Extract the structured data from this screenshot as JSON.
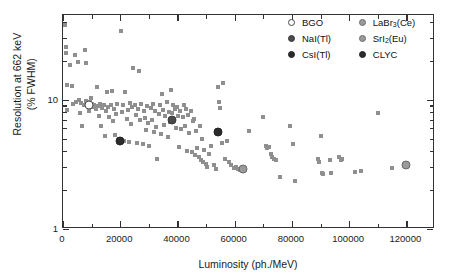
{
  "chart_data": {
    "type": "scatter",
    "title": "",
    "xlabel": "Luminosity (ph./MeV)",
    "ylabel": "Resolution at 662 keV (% FWHM)",
    "ylabel_line1": "Resolution at 662 keV",
    "ylabel_line2": "(% FWHM)",
    "xlim": [
      0,
      130000
    ],
    "ylim": [
      1,
      45
    ],
    "yscale": "log",
    "xscale": "linear",
    "grid": false,
    "legend_position": "top-right",
    "x_ticks_major": [
      0,
      20000,
      40000,
      60000,
      80000,
      100000,
      120000
    ],
    "x_tick_labels": [
      "0",
      "20000",
      "40000",
      "60000",
      "80000",
      "100000",
      "120000"
    ],
    "x_ticks_minor": [
      10000,
      30000,
      50000,
      70000,
      90000,
      110000
    ],
    "y_ticks_major": [
      1,
      10
    ],
    "y_tick_labels": [
      "1",
      "10"
    ],
    "y_ticks_minor": [
      2,
      3,
      4,
      5,
      6,
      7,
      8,
      9,
      20,
      30,
      40
    ],
    "series": [
      {
        "name": "scintillator-survey",
        "marker": "square",
        "color": "#8f8f8f",
        "points": [
          [
            700,
            38.0
          ],
          [
            900,
            25.5
          ],
          [
            1100,
            23.0
          ],
          [
            1300,
            13.0
          ],
          [
            1500,
            8.3
          ],
          [
            2600,
            18.5
          ],
          [
            3100,
            12.8
          ],
          [
            3400,
            9.2
          ],
          [
            4200,
            22.0
          ],
          [
            4600,
            9.6
          ],
          [
            5200,
            19.5
          ],
          [
            5600,
            9.9
          ],
          [
            6000,
            7.9
          ],
          [
            6400,
            9.4
          ],
          [
            6800,
            6.3
          ],
          [
            7200,
            9.1
          ],
          [
            7600,
            24.0
          ],
          [
            7900,
            19.3
          ],
          [
            8200,
            9.7
          ],
          [
            8600,
            9.0
          ],
          [
            9000,
            8.1
          ],
          [
            9400,
            9.5
          ],
          [
            9800,
            10.3
          ],
          [
            10200,
            9.2
          ],
          [
            10600,
            8.7
          ],
          [
            11000,
            9.0
          ],
          [
            11400,
            8.4
          ],
          [
            11800,
            12.5
          ],
          [
            12200,
            8.9
          ],
          [
            12600,
            7.5
          ],
          [
            13000,
            9.3
          ],
          [
            13400,
            6.2
          ],
          [
            13800,
            8.6
          ],
          [
            14200,
            9.1
          ],
          [
            14600,
            5.2
          ],
          [
            15000,
            8.2
          ],
          [
            15400,
            11.4
          ],
          [
            15800,
            8.8
          ],
          [
            16200,
            7.3
          ],
          [
            16600,
            9.0
          ],
          [
            17000,
            11.6
          ],
          [
            17400,
            6.8
          ],
          [
            17800,
            8.5
          ],
          [
            18200,
            5.3
          ],
          [
            18600,
            7.8
          ],
          [
            19000,
            9.2
          ],
          [
            19400,
            5.0
          ],
          [
            19800,
            4.9
          ],
          [
            20200,
            34.0
          ],
          [
            20600,
            8.0
          ],
          [
            21000,
            9.1
          ],
          [
            21400,
            4.8
          ],
          [
            21800,
            11.5
          ],
          [
            22200,
            7.1
          ],
          [
            22600,
            8.3
          ],
          [
            23000,
            4.7
          ],
          [
            23400,
            9.4
          ],
          [
            23800,
            6.5
          ],
          [
            24200,
            8.7
          ],
          [
            24600,
            17.5
          ],
          [
            25000,
            9.0
          ],
          [
            25400,
            7.6
          ],
          [
            25800,
            4.6
          ],
          [
            26200,
            8.4
          ],
          [
            26600,
            16.5
          ],
          [
            27000,
            6.9
          ],
          [
            27400,
            9.2
          ],
          [
            27800,
            4.5
          ],
          [
            28200,
            8.1
          ],
          [
            28600,
            7.2
          ],
          [
            29000,
            5.8
          ],
          [
            29400,
            8.9
          ],
          [
            29800,
            6.6
          ],
          [
            30200,
            4.4
          ],
          [
            30600,
            8.6
          ],
          [
            31000,
            7.0
          ],
          [
            31400,
            9.3
          ],
          [
            31800,
            5.6
          ],
          [
            32200,
            8.2
          ],
          [
            32600,
            6.1
          ],
          [
            33000,
            3.5
          ],
          [
            33400,
            7.7
          ],
          [
            33800,
            9.0
          ],
          [
            34200,
            5.4
          ],
          [
            34600,
            11.0
          ],
          [
            35000,
            8.3
          ],
          [
            35400,
            6.4
          ],
          [
            35800,
            7.4
          ],
          [
            36200,
            9.6
          ],
          [
            36600,
            5.1
          ],
          [
            37000,
            8.0
          ],
          [
            37400,
            6.7
          ],
          [
            37800,
            11.8
          ],
          [
            38200,
            7.9
          ],
          [
            38600,
            9.1
          ],
          [
            39000,
            8.5
          ],
          [
            39400,
            6.0
          ],
          [
            39800,
            8.8
          ],
          [
            40200,
            7.5
          ],
          [
            40600,
            4.3
          ],
          [
            41000,
            8.1
          ],
          [
            41400,
            5.9
          ],
          [
            41800,
            7.3
          ],
          [
            42200,
            9.0
          ],
          [
            42600,
            6.2
          ],
          [
            43000,
            8.4
          ],
          [
            43400,
            4.0
          ],
          [
            43800,
            7.6
          ],
          [
            44200,
            5.5
          ],
          [
            44600,
            8.2
          ],
          [
            45000,
            3.9
          ],
          [
            45400,
            6.8
          ],
          [
            45800,
            7.1
          ],
          [
            46200,
            3.7
          ],
          [
            46600,
            5.7
          ],
          [
            47000,
            4.2
          ],
          [
            47400,
            3.6
          ],
          [
            47800,
            6.3
          ],
          [
            48200,
            3.4
          ],
          [
            48600,
            5.0
          ],
          [
            49000,
            3.3
          ],
          [
            49400,
            4.1
          ],
          [
            49800,
            3.2
          ],
          [
            50200,
            3.0
          ],
          [
            51000,
            3.8
          ],
          [
            51800,
            4.4
          ],
          [
            52600,
            3.1
          ],
          [
            53400,
            2.9
          ],
          [
            54200,
            12.5
          ],
          [
            54600,
            9.5
          ],
          [
            55000,
            8.6
          ],
          [
            55400,
            4.6
          ],
          [
            56000,
            13.5
          ],
          [
            56600,
            3.5
          ],
          [
            57200,
            4.8
          ],
          [
            58000,
            3.3
          ],
          [
            58800,
            3.1
          ],
          [
            59600,
            2.95
          ],
          [
            60400,
            3.0
          ],
          [
            61200,
            2.9
          ],
          [
            62000,
            2.85
          ],
          [
            63000,
            2.8
          ],
          [
            65000,
            5.7
          ],
          [
            70000,
            7.3
          ],
          [
            70800,
            4.4
          ],
          [
            71400,
            4.2
          ],
          [
            72000,
            4.3
          ],
          [
            72600,
            3.8
          ],
          [
            73200,
            3.6
          ],
          [
            73800,
            3.5
          ],
          [
            74400,
            3.4
          ],
          [
            76000,
            2.5
          ],
          [
            79500,
            6.2
          ],
          [
            80500,
            4.5
          ],
          [
            81200,
            2.35
          ],
          [
            89200,
            3.5
          ],
          [
            89600,
            3.3
          ],
          [
            90000,
            5.2
          ],
          [
            90400,
            2.7
          ],
          [
            90800,
            2.65
          ],
          [
            93200,
            3.4
          ],
          [
            93800,
            2.7
          ],
          [
            96400,
            3.6
          ],
          [
            97000,
            3.4
          ],
          [
            97600,
            3.5
          ],
          [
            102000,
            2.75
          ],
          [
            104000,
            2.8
          ],
          [
            110000,
            7.9
          ],
          [
            115000,
            2.95
          ]
        ]
      }
    ],
    "highlighted": [
      {
        "name": "BGO",
        "x": 9000,
        "y": 9.0,
        "style": "open"
      },
      {
        "name": "NaI(Tl)",
        "x": 38000,
        "y": 7.0,
        "style": "dark"
      },
      {
        "name": "CsI(Tl)",
        "x": 54000,
        "y": 5.6,
        "style": "vdark"
      },
      {
        "name": "LaBr3(Ce)",
        "x": 63000,
        "y": 2.9,
        "style": "mid"
      },
      {
        "name": "SrI2(Eu)",
        "x": 120000,
        "y": 3.1,
        "style": "mid"
      },
      {
        "name": "CLYC",
        "x": 20000,
        "y": 4.8,
        "style": "vdark"
      }
    ],
    "legend": {
      "columns": [
        [
          {
            "label": "BGO",
            "style": "open",
            "sub": null
          },
          {
            "label": "NaI(Tl)",
            "style": "dark",
            "sub": null
          },
          {
            "label": "CsI(Tl)",
            "style": "vdark",
            "sub": null
          }
        ],
        [
          {
            "label": "LaBr",
            "sub": "3",
            "suffix": "(Ce)",
            "style": "mid"
          },
          {
            "label": "SrI",
            "sub": "2",
            "suffix": "(Eu)",
            "style": "mid"
          },
          {
            "label": "CLYC",
            "sub": null,
            "suffix": "",
            "style": "vdark"
          }
        ]
      ]
    },
    "colors": {
      "marker": "#8f8f8f",
      "axis": "#333333",
      "text": "#1a1a1a",
      "background": "#ffffff",
      "highlight_open": "#fdfdfd",
      "highlight_mid": "#9a9a9a",
      "highlight_dark": "#4a4a4a",
      "highlight_vdark": "#2b2b2b"
    }
  }
}
